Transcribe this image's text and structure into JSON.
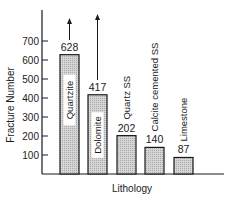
{
  "chart_data": {
    "type": "bar",
    "title": "",
    "xlabel": "Lithology",
    "ylabel": "Fracture Number",
    "categories": [
      "Quartzite",
      "Dolomite",
      "Quartz SS",
      "Calcite cemented SS",
      "Limestone"
    ],
    "values": [
      628,
      417,
      202,
      140,
      87
    ],
    "value_labels": [
      "628",
      "417",
      "202",
      "140",
      "87"
    ],
    "yticks": [
      100,
      200,
      300,
      400,
      500,
      600,
      700
    ],
    "ytick_labels": [
      "100",
      "200",
      "300",
      "400",
      "500",
      "600",
      "700"
    ],
    "ylim": [
      0,
      850
    ],
    "grid": false,
    "legend": null,
    "annotations": [
      {
        "category": "Quartzite",
        "type": "up-arrow",
        "meaning": "value extends beyond measured"
      },
      {
        "category": "Dolomite",
        "type": "up-arrow",
        "meaning": "value extends beyond measured"
      }
    ],
    "bar_fill": "#c8c8c8",
    "bar_stroke": "#1a1a1a"
  }
}
